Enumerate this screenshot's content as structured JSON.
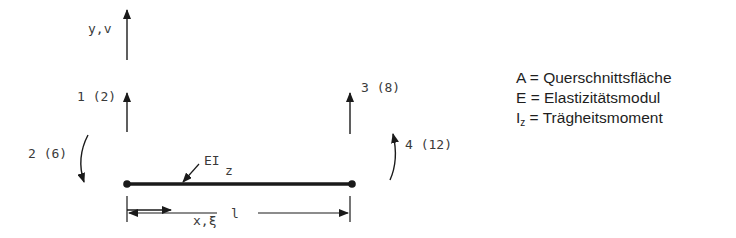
{
  "diagram": {
    "axis_y_label": "y,v",
    "axis_x_label": "x,ξ",
    "stiffness_label": "EI",
    "stiffness_subscript": "z",
    "length_label": "l",
    "dofs": [
      {
        "id": "dof-1",
        "label": "1 (2)",
        "type": "translation",
        "node": "left",
        "direction": "up"
      },
      {
        "id": "dof-2",
        "label": "2 (6)",
        "type": "rotation",
        "node": "left",
        "direction": "clockwise"
      },
      {
        "id": "dof-3",
        "label": "3 (8)",
        "type": "translation",
        "node": "right",
        "direction": "up"
      },
      {
        "id": "dof-4",
        "label": "4 (12)",
        "type": "rotation",
        "node": "right",
        "direction": "counterclockwise"
      }
    ],
    "colors": {
      "line": "#1a1a1a",
      "text": "#3a3a3a"
    }
  },
  "legend": {
    "items": [
      {
        "symbol": "A",
        "sub": "",
        "eq": " = ",
        "text": "Querschnittsfläche"
      },
      {
        "symbol": "E",
        "sub": "",
        "eq": " = ",
        "text": "Elastizitätsmodul"
      },
      {
        "symbol": "I",
        "sub": "z",
        "eq": " = ",
        "text": "Trägheitsmoment"
      }
    ]
  }
}
